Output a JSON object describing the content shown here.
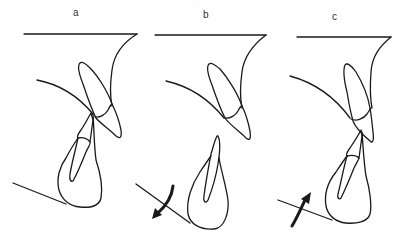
{
  "figure": {
    "panels": [
      {
        "id": "a",
        "label": "a",
        "arrow": "none"
      },
      {
        "id": "b",
        "label": "b",
        "arrow": "clockwise-down"
      },
      {
        "id": "c",
        "label": "c",
        "arrow": "counterclockwise-up"
      }
    ],
    "colors": {
      "stroke": "#1a1a1a",
      "background": "#ffffff",
      "label": "#333333"
    }
  }
}
